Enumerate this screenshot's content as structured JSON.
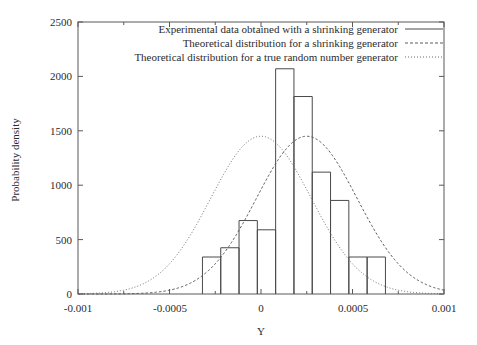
{
  "chart_data": {
    "type": "bar",
    "title": "",
    "subtitle": "",
    "xlabel": "Y",
    "ylabel": "Probability density",
    "xlim": [
      -0.001,
      0.001
    ],
    "ylim": [
      0,
      2500
    ],
    "grid": false,
    "legend_position": "top-right-inside",
    "x_ticks": [
      "-0.001",
      "-0.0005",
      "0",
      "0.0005",
      "0.001"
    ],
    "x_tick_values": [
      -0.001,
      -0.0005,
      0,
      0.0005,
      0.001
    ],
    "x_minor_tick_values": [
      -0.00075,
      -0.00025,
      0.00025,
      0.00075
    ],
    "y_ticks": [
      "0",
      "500",
      "1000",
      "1500",
      "2000",
      "2500"
    ],
    "y_tick_values": [
      0,
      500,
      1000,
      1500,
      2000,
      2500
    ],
    "histogram": {
      "name": "Experimental data obtained with a shrinking generator",
      "bin_width": 0.0001,
      "bin_edges": [
        -0.00032,
        -0.00022,
        -0.00012,
        -2e-05,
        8e-05,
        0.00018,
        0.00028,
        0.00038,
        0.00048,
        0.00058,
        0.00068,
        0.00078
      ],
      "bin_centers": [
        -0.00027,
        -0.00017,
        -7e-05,
        3e-05,
        0.00013,
        0.00023,
        0.00033,
        0.00043,
        0.00053,
        0.00063,
        0.00073
      ],
      "values": [
        340,
        425,
        675,
        590,
        2070,
        1815,
        1120,
        860,
        340,
        340,
        0
      ]
    },
    "series": [
      {
        "name": "Theoretical distribution for a shrinking generator",
        "style": "dashed",
        "type": "gaussian",
        "mean": 0.00025,
        "sigma": 0.000275,
        "peak": 1450
      },
      {
        "name": "Theoretical distribution for a true random number generator",
        "style": "dotted",
        "type": "gaussian",
        "mean": 0.0,
        "sigma": 0.000275,
        "peak": 1450
      }
    ]
  },
  "legend": {
    "entries": [
      {
        "label": "Experimental data obtained with a shrinking generator",
        "key": "solid-line-key"
      },
      {
        "label": "Theoretical distribution for a shrinking generator",
        "key": "dashed-line-key"
      },
      {
        "label": "Theoretical distribution for a true random number generator",
        "key": "dotted-line-key"
      }
    ]
  },
  "axes": {
    "y_label": "Probability density",
    "x_label": "Y",
    "y_tick_labels": [
      "2500",
      "2000",
      "1500",
      "1000",
      "500",
      "0"
    ],
    "x_tick_labels": [
      "-0.001",
      "-0.0005",
      "0",
      "0.0005",
      "0.001"
    ]
  },
  "colors": {
    "line": "#4a4a4a",
    "axis": "#595959",
    "text": "#2b2b2b",
    "background": "#ffffff"
  }
}
